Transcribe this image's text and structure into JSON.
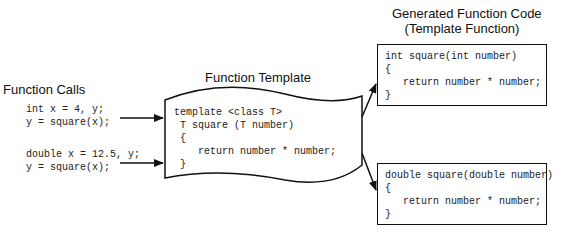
{
  "calls": {
    "title": "Function Calls",
    "group1": [
      "int x = 4, y;",
      "y = square(x);"
    ],
    "group2": [
      "double x = 12.5, y;",
      "y = square(x);"
    ]
  },
  "template": {
    "title": "Function Template",
    "lines": [
      "template <class T>",
      " T square (T number)",
      " {",
      "    return number * number;",
      " }"
    ]
  },
  "generated": {
    "title_line1": "Generated Function Code",
    "title_line2": "(Template Function)",
    "int_fn": [
      "int square(int number)",
      "{",
      "   return number * number;",
      "}"
    ],
    "double_fn": [
      "double square(double number)",
      "{",
      "   return number * number;",
      "}"
    ]
  },
  "colors": {
    "stroke": "#111111",
    "text": "#222222",
    "background": "#ffffff"
  }
}
